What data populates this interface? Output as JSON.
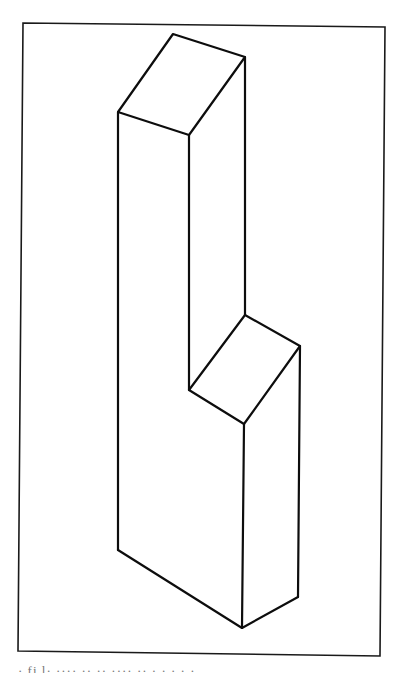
{
  "figure": {
    "line_color": "#0d0d0d",
    "background_color": "#ffffff",
    "parts": [
      "top-face",
      "step-face",
      "left-face",
      "front-upper-face",
      "front-lower-face",
      "right-face"
    ]
  },
  "caption": {
    "text": "· fi l· ···· ·· ··  ···· ·· · · ·  · ·",
    "legible": false
  }
}
